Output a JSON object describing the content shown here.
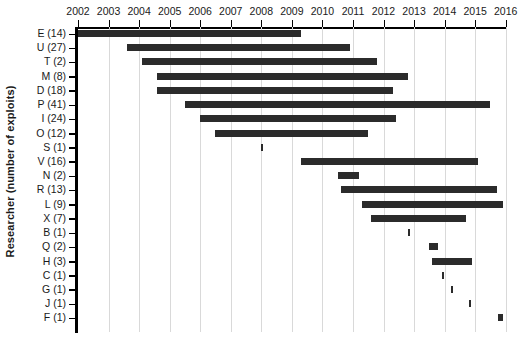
{
  "chart_data": {
    "type": "bar",
    "orientation": "horizontal-gantt",
    "title": "",
    "xlabel": "",
    "ylabel": "Researcher (number of exploits)",
    "xlim": [
      2002,
      2016
    ],
    "xticks": [
      "2002",
      "2003",
      "2004",
      "2005",
      "2006",
      "2007",
      "2008",
      "2009",
      "2010",
      "2011",
      "2012",
      "2013",
      "2014",
      "2015",
      "2016"
    ],
    "grid": true,
    "legend": null,
    "bar_color": "#2b2b2b",
    "categories": [
      "E (14)",
      "U (27)",
      "T (2)",
      "M (8)",
      "D (18)",
      "P (41)",
      "I (24)",
      "O (12)",
      "S (1)",
      "V (16)",
      "N (2)",
      "R (13)",
      "L (9)",
      "X (7)",
      "B (1)",
      "Q (2)",
      "H (3)",
      "C (1)",
      "G (1)",
      "J (1)",
      "F (1)"
    ],
    "spans": [
      {
        "label": "E (14)",
        "researcher": "E",
        "exploits": 14,
        "start": 2002.0,
        "end": 2009.3
      },
      {
        "label": "U (27)",
        "researcher": "U",
        "exploits": 27,
        "start": 2003.6,
        "end": 2010.9
      },
      {
        "label": "T (2)",
        "researcher": "T",
        "exploits": 2,
        "start": 2004.1,
        "end": 2011.8
      },
      {
        "label": "M (8)",
        "researcher": "M",
        "exploits": 8,
        "start": 2004.6,
        "end": 2012.8
      },
      {
        "label": "D (18)",
        "researcher": "D",
        "exploits": 18,
        "start": 2004.6,
        "end": 2012.3
      },
      {
        "label": "P (41)",
        "researcher": "P",
        "exploits": 41,
        "start": 2005.5,
        "end": 2015.5
      },
      {
        "label": "I (24)",
        "researcher": "I",
        "exploits": 24,
        "start": 2006.0,
        "end": 2012.4
      },
      {
        "label": "O (12)",
        "researcher": "O",
        "exploits": 12,
        "start": 2006.5,
        "end": 2011.5
      },
      {
        "label": "S (1)",
        "researcher": "S",
        "exploits": 1,
        "start": 2008.0,
        "end": 2008.05
      },
      {
        "label": "V (16)",
        "researcher": "V",
        "exploits": 16,
        "start": 2009.3,
        "end": 2015.1
      },
      {
        "label": "N (2)",
        "researcher": "N",
        "exploits": 2,
        "start": 2010.5,
        "end": 2011.2
      },
      {
        "label": "R (13)",
        "researcher": "R",
        "exploits": 13,
        "start": 2010.6,
        "end": 2015.7
      },
      {
        "label": "L (9)",
        "researcher": "L",
        "exploits": 9,
        "start": 2011.3,
        "end": 2015.9
      },
      {
        "label": "X (7)",
        "researcher": "X",
        "exploits": 7,
        "start": 2011.6,
        "end": 2014.7
      },
      {
        "label": "B (1)",
        "researcher": "B",
        "exploits": 1,
        "start": 2012.8,
        "end": 2012.85
      },
      {
        "label": "Q (2)",
        "researcher": "Q",
        "exploits": 2,
        "start": 2013.5,
        "end": 2013.8
      },
      {
        "label": "H (3)",
        "researcher": "H",
        "exploits": 3,
        "start": 2013.6,
        "end": 2014.9
      },
      {
        "label": "C (1)",
        "researcher": "C",
        "exploits": 1,
        "start": 2013.9,
        "end": 2013.95
      },
      {
        "label": "G (1)",
        "researcher": "G",
        "exploits": 1,
        "start": 2014.2,
        "end": 2014.25
      },
      {
        "label": "J (1)",
        "researcher": "J",
        "exploits": 1,
        "start": 2014.8,
        "end": 2014.85
      },
      {
        "label": "F (1)",
        "researcher": "F",
        "exploits": 1,
        "start": 2015.75,
        "end": 2015.9
      }
    ]
  }
}
